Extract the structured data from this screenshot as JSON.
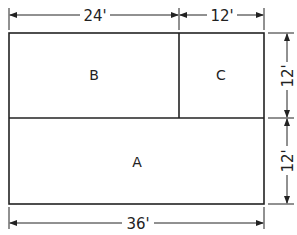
{
  "diagram": {
    "regions": [
      {
        "id": "B",
        "label": "B"
      },
      {
        "id": "C",
        "label": "C"
      },
      {
        "id": "A",
        "label": "A"
      }
    ],
    "dimensions": {
      "top_left": "24'",
      "top_right": "12'",
      "right_upper": "12'",
      "right_lower": "12'",
      "bottom": "36'"
    },
    "colors": {
      "line": "#222222",
      "background": "#ffffff"
    }
  }
}
